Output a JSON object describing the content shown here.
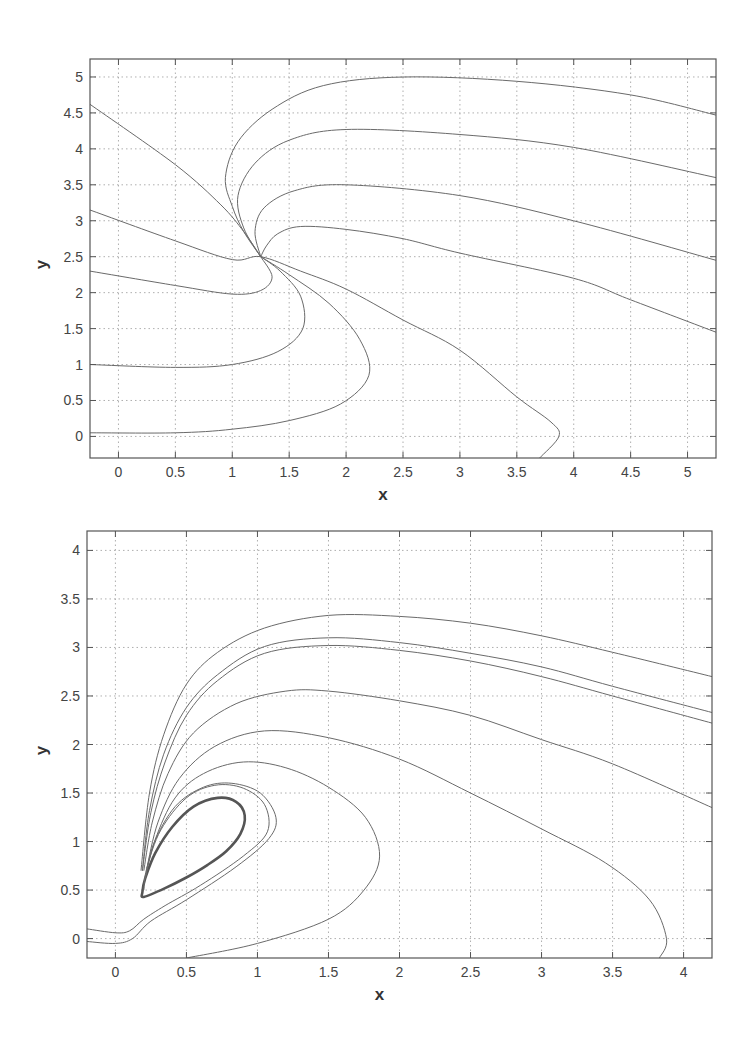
{
  "chart_data": [
    {
      "type": "line",
      "title": "",
      "xlabel": "x",
      "ylabel": "y",
      "xlim": [
        -0.25,
        5.25
      ],
      "ylim": [
        -0.3,
        5.25
      ],
      "xticks": [
        0,
        0.5,
        1,
        1.5,
        2,
        2.5,
        3,
        3.5,
        4,
        4.5,
        5
      ],
      "xtick_labels": [
        "0",
        "0.5",
        "1",
        "1.5",
        "2",
        "2.5",
        "3",
        "3.5",
        "4",
        "4.5",
        "5"
      ],
      "yticks": [
        0,
        0.5,
        1,
        1.5,
        2,
        2.5,
        3,
        3.5,
        4,
        4.5,
        5
      ],
      "ytick_labels": [
        "0",
        "0.5",
        "1",
        "1.5",
        "2",
        "2.5",
        "3",
        "3.5",
        "4",
        "4.5",
        "5"
      ],
      "grid": true,
      "legend": null,
      "annotations": [
        "stable node near (1.25, 2.5)"
      ],
      "pixel_box": {
        "left": 90,
        "top": 59,
        "right": 716,
        "bottom": 458
      },
      "series": [
        {
          "name": "traj-1",
          "points": [
            [
              5.25,
              4.47
            ],
            [
              4.5,
              4.75
            ],
            [
              3.5,
              4.94
            ],
            [
              2.5,
              5.0
            ],
            [
              1.8,
              4.88
            ],
            [
              1.35,
              4.55
            ],
            [
              1.05,
              4.1
            ],
            [
              0.94,
              3.6
            ],
            [
              1.0,
              3.2
            ],
            [
              1.1,
              2.85
            ],
            [
              1.25,
              2.5
            ]
          ]
        },
        {
          "name": "traj-2",
          "points": [
            [
              5.25,
              3.6
            ],
            [
              4.0,
              4.02
            ],
            [
              3.0,
              4.2
            ],
            [
              2.0,
              4.27
            ],
            [
              1.5,
              4.12
            ],
            [
              1.2,
              3.8
            ],
            [
              1.05,
              3.35
            ],
            [
              1.1,
              2.9
            ],
            [
              1.25,
              2.5
            ]
          ]
        },
        {
          "name": "traj-3",
          "points": [
            [
              5.25,
              2.45
            ],
            [
              4.0,
              3.0
            ],
            [
              3.0,
              3.35
            ],
            [
              2.0,
              3.5
            ],
            [
              1.55,
              3.42
            ],
            [
              1.28,
              3.18
            ],
            [
              1.2,
              2.85
            ],
            [
              1.25,
              2.5
            ]
          ]
        },
        {
          "name": "traj-4",
          "points": [
            [
              5.25,
              1.45
            ],
            [
              4.5,
              1.9
            ],
            [
              4.0,
              2.2
            ],
            [
              3.0,
              2.55
            ],
            [
              2.5,
              2.75
            ],
            [
              2.0,
              2.88
            ],
            [
              1.6,
              2.92
            ],
            [
              1.4,
              2.82
            ],
            [
              1.3,
              2.65
            ],
            [
              1.25,
              2.5
            ]
          ]
        },
        {
          "name": "traj-5",
          "points": [
            [
              -0.25,
              4.62
            ],
            [
              0.5,
              3.78
            ],
            [
              0.9,
              3.22
            ],
            [
              1.1,
              2.85
            ],
            [
              1.25,
              2.5
            ]
          ]
        },
        {
          "name": "traj-6",
          "points": [
            [
              -0.25,
              3.15
            ],
            [
              0.5,
              2.72
            ],
            [
              1.0,
              2.46
            ],
            [
              1.25,
              2.5
            ],
            [
              1.6,
              2.3
            ],
            [
              2.0,
              2.05
            ],
            [
              2.5,
              1.62
            ],
            [
              3.0,
              1.2
            ],
            [
              3.5,
              0.55
            ],
            [
              3.8,
              0.2
            ],
            [
              3.87,
              0.0
            ],
            [
              3.7,
              -0.3
            ]
          ]
        },
        {
          "name": "traj-7",
          "points": [
            [
              -0.25,
              2.3
            ],
            [
              0.5,
              2.1
            ],
            [
              1.0,
              1.98
            ],
            [
              1.25,
              2.03
            ],
            [
              1.35,
              2.22
            ],
            [
              1.25,
              2.5
            ]
          ]
        },
        {
          "name": "traj-8",
          "points": [
            [
              -0.25,
              1.0
            ],
            [
              0.5,
              0.96
            ],
            [
              1.0,
              1.0
            ],
            [
              1.4,
              1.18
            ],
            [
              1.62,
              1.5
            ],
            [
              1.6,
              1.95
            ],
            [
              1.42,
              2.3
            ],
            [
              1.25,
              2.5
            ]
          ]
        },
        {
          "name": "traj-9",
          "points": [
            [
              -0.25,
              0.05
            ],
            [
              0.5,
              0.05
            ],
            [
              1.0,
              0.1
            ],
            [
              1.5,
              0.22
            ],
            [
              1.95,
              0.45
            ],
            [
              2.2,
              0.85
            ],
            [
              2.12,
              1.35
            ],
            [
              1.85,
              1.85
            ],
            [
              1.5,
              2.25
            ],
            [
              1.25,
              2.5
            ]
          ]
        }
      ]
    },
    {
      "type": "line",
      "title": "",
      "xlabel": "x",
      "ylabel": "y",
      "xlim": [
        -0.2,
        4.2
      ],
      "ylim": [
        -0.2,
        4.2
      ],
      "xticks": [
        0,
        0.5,
        1,
        1.5,
        2,
        2.5,
        3,
        3.5,
        4
      ],
      "xtick_labels": [
        "0",
        "0.5",
        "1",
        "1.5",
        "2",
        "2.5",
        "3",
        "3.5",
        "4"
      ],
      "yticks": [
        0,
        0.5,
        1,
        1.5,
        2,
        2.5,
        3,
        3.5,
        4
      ],
      "ytick_labels": [
        "0",
        "0.5",
        "1",
        "1.5",
        "2",
        "2.5",
        "3",
        "3.5",
        "4"
      ],
      "grid": true,
      "legend": null,
      "annotations": [
        "stable limit cycle (thick curve)"
      ],
      "pixel_box": {
        "left": 87,
        "top": 531,
        "right": 712,
        "bottom": 958
      },
      "series": [
        {
          "name": "limit-cycle",
          "thick": true,
          "closed": true,
          "points": [
            [
              0.2,
              0.43
            ],
            [
              0.35,
              0.52
            ],
            [
              0.5,
              0.63
            ],
            [
              0.65,
              0.76
            ],
            [
              0.78,
              0.9
            ],
            [
              0.88,
              1.08
            ],
            [
              0.91,
              1.27
            ],
            [
              0.85,
              1.41
            ],
            [
              0.72,
              1.45
            ],
            [
              0.55,
              1.36
            ],
            [
              0.4,
              1.15
            ],
            [
              0.28,
              0.88
            ],
            [
              0.21,
              0.62
            ],
            [
              0.19,
              0.48
            ]
          ]
        },
        {
          "name": "traj-a",
          "points": [
            [
              -0.2,
              0.1
            ],
            [
              0.0,
              0.06
            ],
            [
              0.1,
              0.08
            ],
            [
              0.2,
              0.2
            ],
            [
              0.35,
              0.34
            ],
            [
              0.6,
              0.55
            ],
            [
              0.9,
              0.85
            ],
            [
              1.07,
              1.1
            ],
            [
              1.05,
              1.38
            ],
            [
              0.9,
              1.55
            ],
            [
              0.7,
              1.58
            ],
            [
              0.5,
              1.45
            ],
            [
              0.32,
              1.12
            ],
            [
              0.22,
              0.72
            ],
            [
              0.2,
              0.5
            ]
          ]
        },
        {
          "name": "traj-b",
          "points": [
            [
              -0.2,
              -0.03
            ],
            [
              0.0,
              -0.05
            ],
            [
              0.12,
              0.0
            ],
            [
              0.25,
              0.18
            ],
            [
              0.5,
              0.4
            ],
            [
              0.85,
              0.74
            ],
            [
              1.08,
              1.03
            ],
            [
              1.13,
              1.25
            ],
            [
              1.02,
              1.5
            ],
            [
              0.82,
              1.6
            ],
            [
              0.62,
              1.56
            ],
            [
              0.42,
              1.36
            ],
            [
              0.27,
              0.98
            ],
            [
              0.21,
              0.62
            ]
          ]
        },
        {
          "name": "traj-c",
          "points": [
            [
              0.5,
              -0.2
            ],
            [
              1.0,
              -0.05
            ],
            [
              1.5,
              0.2
            ],
            [
              1.75,
              0.5
            ],
            [
              1.86,
              0.85
            ],
            [
              1.76,
              1.25
            ],
            [
              1.5,
              1.56
            ],
            [
              1.2,
              1.76
            ],
            [
              0.9,
              1.82
            ],
            [
              0.62,
              1.7
            ],
            [
              0.42,
              1.45
            ],
            [
              0.28,
              1.02
            ],
            [
              0.21,
              0.62
            ]
          ]
        },
        {
          "name": "traj-d",
          "points": [
            [
              3.83,
              -0.2
            ],
            [
              3.88,
              0.0
            ],
            [
              3.76,
              0.4
            ],
            [
              3.45,
              0.78
            ],
            [
              3.0,
              1.13
            ],
            [
              2.5,
              1.5
            ],
            [
              2.0,
              1.85
            ],
            [
              1.5,
              2.07
            ],
            [
              1.05,
              2.14
            ],
            [
              0.7,
              1.98
            ],
            [
              0.45,
              1.65
            ],
            [
              0.3,
              1.2
            ],
            [
              0.22,
              0.72
            ]
          ]
        },
        {
          "name": "traj-e",
          "points": [
            [
              4.2,
              1.35
            ],
            [
              3.5,
              1.8
            ],
            [
              3.0,
              2.05
            ],
            [
              2.5,
              2.3
            ],
            [
              2.0,
              2.45
            ],
            [
              1.5,
              2.55
            ],
            [
              1.2,
              2.55
            ],
            [
              0.85,
              2.42
            ],
            [
              0.55,
              2.12
            ],
            [
              0.37,
              1.7
            ],
            [
              0.26,
              1.2
            ],
            [
              0.2,
              0.7
            ]
          ]
        },
        {
          "name": "traj-f",
          "points": [
            [
              4.2,
              2.22
            ],
            [
              3.5,
              2.5
            ],
            [
              3.0,
              2.7
            ],
            [
              2.5,
              2.86
            ],
            [
              2.0,
              2.97
            ],
            [
              1.5,
              3.02
            ],
            [
              1.05,
              2.94
            ],
            [
              0.72,
              2.66
            ],
            [
              0.5,
              2.3
            ],
            [
              0.35,
              1.82
            ],
            [
              0.25,
              1.3
            ],
            [
              0.19,
              0.7
            ]
          ]
        },
        {
          "name": "traj-g",
          "points": [
            [
              4.2,
              2.33
            ],
            [
              3.5,
              2.6
            ],
            [
              3.0,
              2.8
            ],
            [
              2.5,
              2.94
            ],
            [
              2.0,
              3.05
            ],
            [
              1.5,
              3.1
            ],
            [
              1.05,
              3.01
            ],
            [
              0.72,
              2.72
            ],
            [
              0.5,
              2.38
            ],
            [
              0.34,
              1.9
            ],
            [
              0.24,
              1.32
            ],
            [
              0.19,
              0.7
            ]
          ]
        },
        {
          "name": "traj-h",
          "points": [
            [
              4.2,
              2.7
            ],
            [
              3.5,
              2.95
            ],
            [
              3.0,
              3.12
            ],
            [
              2.5,
              3.25
            ],
            [
              2.0,
              3.32
            ],
            [
              1.5,
              3.33
            ],
            [
              1.05,
              3.2
            ],
            [
              0.72,
              2.95
            ],
            [
              0.5,
              2.62
            ],
            [
              0.34,
              2.1
            ],
            [
              0.24,
              1.5
            ],
            [
              0.18,
              0.7
            ]
          ]
        }
      ]
    }
  ]
}
